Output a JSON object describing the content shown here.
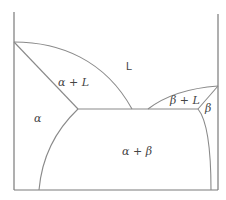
{
  "diagram": {
    "type": "binary eutectic phase diagram",
    "colors": {
      "axis": "#7a7a7a",
      "curve": "#8a8a8a",
      "text": "#444444",
      "background": "#ffffff"
    },
    "regions": {
      "liquid": "L",
      "alpha_plus_liquid": "α + L",
      "beta_plus_liquid": "β + L",
      "alpha": "α",
      "beta": "β",
      "alpha_plus_beta": "α + β"
    }
  }
}
